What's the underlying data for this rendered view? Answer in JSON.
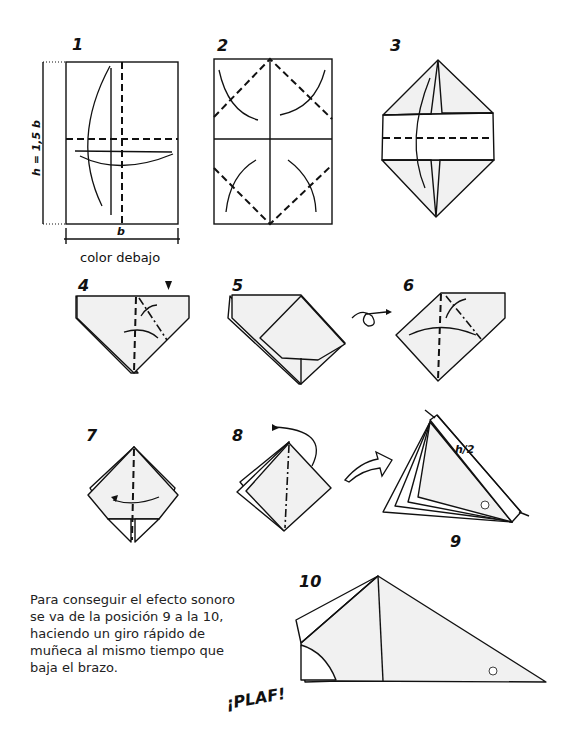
{
  "steps": [
    {
      "number": "1",
      "caption": "color debajo",
      "dim_height": "h = 1,5 b",
      "dim_width": "b"
    },
    {
      "number": "2"
    },
    {
      "number": "3"
    },
    {
      "number": "4"
    },
    {
      "number": "5"
    },
    {
      "number": "6"
    },
    {
      "number": "7"
    },
    {
      "number": "8"
    },
    {
      "number": "9",
      "dim_label": "h/2"
    },
    {
      "number": "10"
    }
  ],
  "instructions": {
    "lines": [
      "Para conseguir el efecto sonoro",
      "se va de la posición 9 a la 10,",
      "haciendo un giro rápido de",
      "muñeca al mismo tiempo que",
      "baja el brazo."
    ]
  },
  "sound_effect": "¡PLAF!",
  "colors": {
    "paper_shade": "#f1f1f1",
    "line": "#111111"
  }
}
